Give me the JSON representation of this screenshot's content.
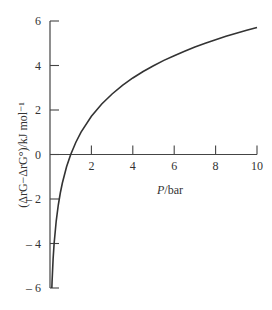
{
  "chart_data": {
    "type": "line",
    "title": "",
    "xlabel": "P/bar",
    "ylabel": "(ΔrG−ΔrG°)/kJ mol⁻¹",
    "xlim": [
      0,
      10
    ],
    "ylim": [
      -6,
      6
    ],
    "grid": false,
    "legend": null,
    "x_ticks": [
      2,
      4,
      6,
      8,
      10
    ],
    "x_tick_labels": [
      "2",
      "4",
      "6",
      "8",
      "10"
    ],
    "y_ticks": [
      6,
      4,
      2,
      0,
      -2,
      -4,
      -6
    ],
    "y_tick_labels": [
      "6",
      "4",
      "2",
      "0",
      "– 2",
      "– 4",
      "– 6"
    ],
    "x_axis_position": "y=0",
    "series": [
      {
        "name": "ΔrG−ΔrG° = RT ln(P/bar)",
        "color": "#333333",
        "x": [
          0.089,
          0.1,
          0.15,
          0.2,
          0.3,
          0.4,
          0.5,
          0.6,
          0.8,
          1.0,
          1.25,
          1.5,
          2,
          2.5,
          3,
          3.5,
          4,
          4.5,
          5,
          5.5,
          6,
          6.5,
          7,
          7.5,
          8,
          8.5,
          9,
          9.5,
          10
        ],
        "y": [
          -6.0,
          -5.71,
          -4.7,
          -3.99,
          -2.99,
          -2.27,
          -1.72,
          -1.27,
          -0.55,
          0.0,
          0.55,
          1.01,
          1.72,
          2.27,
          2.72,
          3.11,
          3.44,
          3.73,
          3.99,
          4.23,
          4.44,
          4.64,
          4.83,
          5.0,
          5.16,
          5.31,
          5.45,
          5.58,
          5.71
        ]
      }
    ]
  }
}
